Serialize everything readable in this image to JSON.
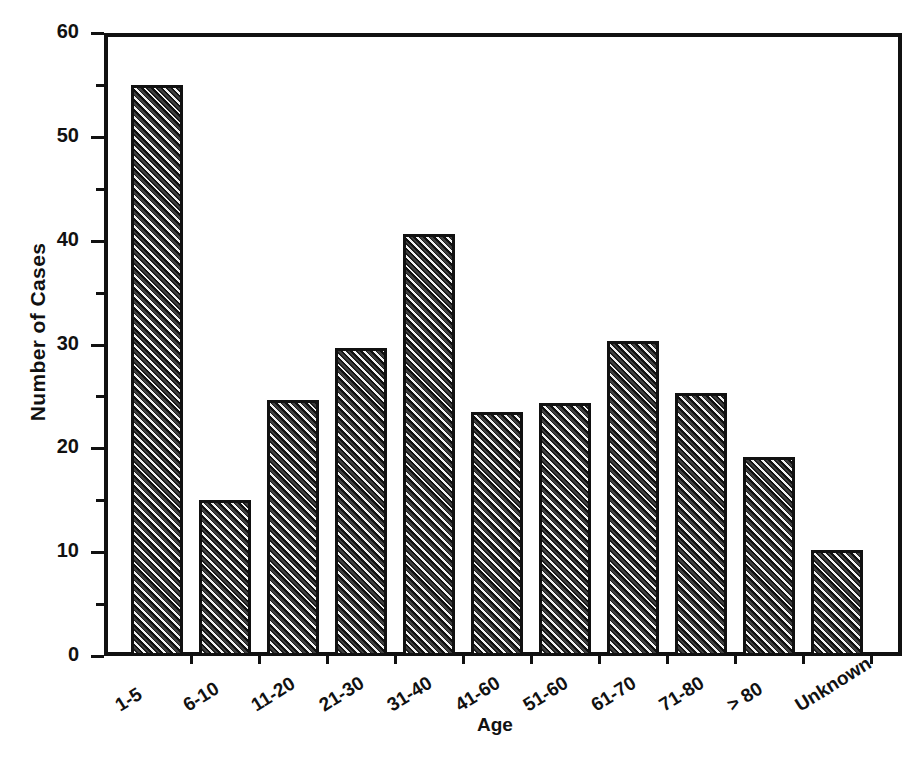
{
  "chart_data": {
    "type": "bar",
    "title": "",
    "xlabel": "Age",
    "ylabel": "Number of Cases",
    "categories": [
      "1-5",
      "6-10",
      "11-20",
      "21-30",
      "31-40",
      "41-60",
      "51-60",
      "61-70",
      "71-80",
      "> 80",
      "Unknown"
    ],
    "values": [
      55,
      15,
      24.7,
      29.7,
      40.6,
      23.5,
      24.4,
      30.3,
      25.3,
      19.2,
      10.2
    ],
    "ylim": [
      0,
      60
    ],
    "xlim_note": "categorical",
    "ytick_labels": [
      "0",
      "10",
      "20",
      "30",
      "40",
      "50",
      "60"
    ],
    "ytick_values": [
      0,
      10,
      20,
      30,
      40,
      50,
      60
    ],
    "yminor_tick_values": [
      5,
      15,
      25,
      35,
      45,
      55
    ],
    "grid": false,
    "legend": false,
    "legend_position": "none",
    "bar_fill": "diagonal-hatch",
    "colors": {
      "axis": "#111111",
      "bar_line": "#111111",
      "bar_fill_dark": "#1c1c1c",
      "bar_fill_light": "#efefef",
      "background": "#ffffff"
    }
  },
  "axes": {
    "y_title": "Number of Cases",
    "x_title": "Age"
  }
}
